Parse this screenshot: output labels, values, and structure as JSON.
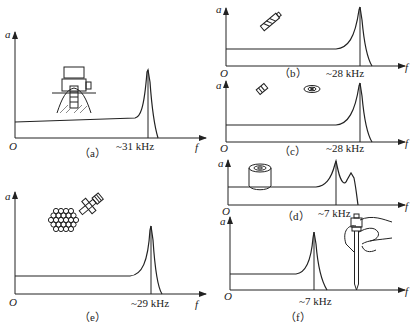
{
  "figure": {
    "panels": [
      {
        "id": "a",
        "caption": "（a）",
        "freq_label": "~31 kHz",
        "y_label": "a",
        "x_label": "f",
        "origin": "O",
        "sensor_mount": "magnetic base on machine"
      },
      {
        "id": "b",
        "caption": "（b）",
        "freq_label": "~28 kHz",
        "y_label": "a",
        "x_label": "f",
        "origin": "O",
        "sensor_mount": "adhesive pad"
      },
      {
        "id": "c",
        "caption": "（c）",
        "freq_label": "~28 kHz",
        "y_label": "a",
        "x_label": "f",
        "origin": "O",
        "sensor_mount": "adhesive disc"
      },
      {
        "id": "d",
        "caption": "（d）",
        "freq_label": "~7 kHz",
        "y_label": "a",
        "x_label": "f",
        "origin": "O",
        "sensor_mount": "magnet"
      },
      {
        "id": "e",
        "caption": "（e）",
        "freq_label": "~29 kHz",
        "y_label": "a",
        "x_label": "f",
        "origin": "O",
        "sensor_mount": "stud on surface"
      },
      {
        "id": "f",
        "caption": "（f）",
        "freq_label": "~7 kHz",
        "y_label": "a",
        "x_label": "f",
        "origin": "O",
        "sensor_mount": "hand-held probe"
      }
    ]
  }
}
